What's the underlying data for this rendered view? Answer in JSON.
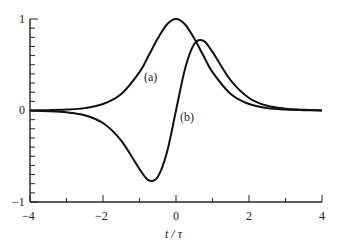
{
  "chart_data": {
    "type": "line",
    "title": "",
    "xlabel": "t/τ",
    "ylabel": "",
    "xlim": [
      -4,
      4
    ],
    "ylim": [
      -1,
      1
    ],
    "x_ticks": [
      "-4",
      "-2",
      "0",
      "2",
      "4"
    ],
    "y_ticks": [
      "-1",
      "0",
      "1"
    ],
    "grid": false,
    "legend": null,
    "annotations": [
      "(a)",
      "(b)"
    ],
    "x": [
      -4,
      -3.5,
      -3,
      -2.5,
      -2,
      -1.5,
      -1,
      -0.75,
      -0.5,
      -0.25,
      0,
      0.25,
      0.5,
      0.75,
      1,
      1.5,
      2,
      2.5,
      3,
      3.5,
      4
    ],
    "series": [
      {
        "name": "(a)",
        "values": [
          0.001,
          0.004,
          0.01,
          0.026,
          0.071,
          0.181,
          0.42,
          0.6,
          0.786,
          0.94,
          1.0,
          0.94,
          0.786,
          0.6,
          0.42,
          0.181,
          0.071,
          0.026,
          0.01,
          0.004,
          0.001
        ]
      },
      {
        "name": "(b)",
        "values": [
          -0.001,
          -0.007,
          -0.02,
          -0.051,
          -0.137,
          -0.329,
          -0.64,
          -0.762,
          -0.726,
          -0.46,
          0.0,
          0.46,
          0.726,
          0.762,
          0.64,
          0.329,
          0.137,
          0.051,
          0.02,
          0.007,
          0.001
        ]
      }
    ]
  },
  "labels": {
    "x_tick_m4": "−4",
    "x_tick_m2": "−2",
    "x_tick_0": "0",
    "x_tick_2": "2",
    "x_tick_4": "4",
    "y_tick_1": "1",
    "y_tick_0": "0",
    "y_tick_m1": "−1",
    "xlabel": "t / τ",
    "curve_a": "(a)",
    "curve_b": "(b)"
  }
}
